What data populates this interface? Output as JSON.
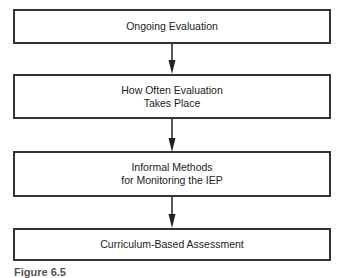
{
  "flowchart": {
    "nodes": [
      {
        "id": "n1",
        "lines": [
          "Ongoing Evaluation"
        ]
      },
      {
        "id": "n2",
        "lines": [
          "How Often Evaluation",
          "Takes Place"
        ]
      },
      {
        "id": "n3",
        "lines": [
          "Informal Methods",
          "for Monitoring the IEP"
        ]
      },
      {
        "id": "n4",
        "lines": [
          "Curriculum-Based Assessment"
        ]
      }
    ],
    "edges": [
      {
        "from": "n1",
        "to": "n2"
      },
      {
        "from": "n2",
        "to": "n3"
      },
      {
        "from": "n3",
        "to": "n4"
      }
    ],
    "caption": "Figure 6.5"
  }
}
